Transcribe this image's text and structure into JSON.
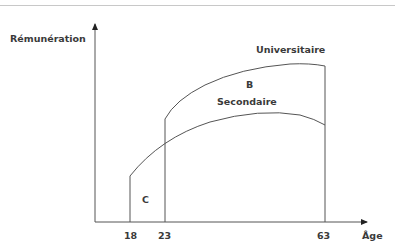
{
  "diagram": {
    "y_axis_label": "Rémunération",
    "x_axis_label": "Âge",
    "ticks": [
      "18",
      "23",
      "63"
    ],
    "curves": [
      {
        "name": "Universitaire",
        "start_age": 23,
        "end_age": 63
      },
      {
        "name": "Secondaire",
        "start_age": 18,
        "end_age": 63
      }
    ],
    "regions": {
      "B": "B",
      "C": "C"
    },
    "colors": {
      "line": "#555555",
      "text": "#3a3a3a"
    }
  }
}
